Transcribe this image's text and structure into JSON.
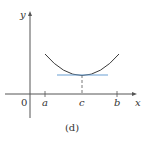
{
  "figure": {
    "caption": "(d)",
    "origin_label": "0",
    "axes": {
      "x_label": "x",
      "y_label": "y"
    },
    "ticks": [
      {
        "label": "a",
        "x": 45
      },
      {
        "label": "c",
        "x": 82
      },
      {
        "label": "b",
        "x": 117
      }
    ],
    "colors": {
      "axis": "#555555",
      "curve": "#3a3a3a",
      "tangent": "#6a9fd4",
      "text": "#333333"
    }
  }
}
